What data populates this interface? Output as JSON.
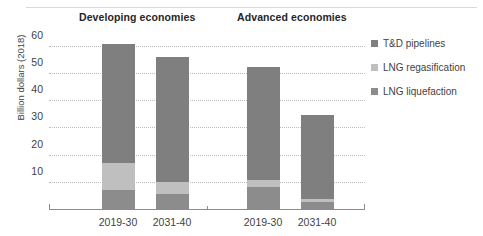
{
  "chart_data": {
    "type": "bar",
    "subtype": "stacked-grouped-column",
    "title": "",
    "xlabel": "",
    "ylabel": "Billion dollars (2018)",
    "ylim": [
      0,
      65
    ],
    "yticks": [
      10,
      20,
      30,
      40,
      50,
      60
    ],
    "grid": true,
    "legend_position": "right",
    "groups": [
      {
        "name": "Developing economies",
        "categories": [
          "2019-30",
          "2031-40"
        ]
      },
      {
        "name": "Advanced economies",
        "categories": [
          "2019-30",
          "2031-40"
        ]
      }
    ],
    "categories": [
      "2019-30",
      "2031-40",
      "2019-30",
      "2031-40"
    ],
    "series": [
      {
        "name": "LNG liquefaction",
        "color": "#8c8c8c",
        "values": [
          7.0,
          5.5,
          8.0,
          2.5
        ]
      },
      {
        "name": "LNG regasification",
        "color": "#bfbfbf",
        "values": [
          10.0,
          4.5,
          2.5,
          1.0
        ]
      },
      {
        "name": "T&D pipelines",
        "color": "#7f7f7f",
        "values": [
          43.5,
          46.0,
          41.5,
          31.0
        ]
      }
    ],
    "totals": [
      60.5,
      56.0,
      52.0,
      34.5
    ]
  },
  "legend": {
    "items": [
      {
        "label": "T&D pipelines",
        "color": "#7f7f7f"
      },
      {
        "label": "LNG regasification",
        "color": "#bfbfbf"
      },
      {
        "label": "LNG liquefaction",
        "color": "#8c8c8c"
      }
    ]
  }
}
